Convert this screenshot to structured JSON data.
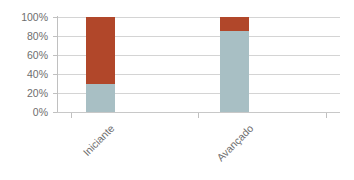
{
  "chart_data": {
    "type": "bar",
    "variant": "stacked-100-percent",
    "title": "",
    "subtitle": "",
    "xlabel": "",
    "ylabel": "",
    "categories": [
      "Iniciante",
      "Avançado"
    ],
    "series": [
      {
        "name": "serie-1",
        "color": "#A8BFC4",
        "values": [
          30,
          85
        ]
      },
      {
        "name": "serie-2",
        "color": "#B1472A",
        "values": [
          70,
          15
        ]
      }
    ],
    "ylim": [
      0,
      100
    ],
    "y_ticks": [
      0,
      20,
      40,
      60,
      80,
      100
    ],
    "y_tick_labels": [
      "0%",
      "20%",
      "40%",
      "60%",
      "80%",
      "100%"
    ],
    "grid": true,
    "grid_axis": "y",
    "legend": false,
    "legend_position": "none"
  },
  "axes": {
    "y": {
      "labels": [
        "100%",
        "80%",
        "60%",
        "40%",
        "20%",
        "0%"
      ]
    },
    "x": {
      "labels": [
        "Iniciante",
        "Avançado"
      ]
    }
  },
  "colors": {
    "series_1": "#A8BFC4",
    "series_2": "#B1472A",
    "gridline": "#d4d4d4",
    "axis": "#c0c0c0",
    "tick_text": "#6e6e6e",
    "background": "#ffffff"
  }
}
